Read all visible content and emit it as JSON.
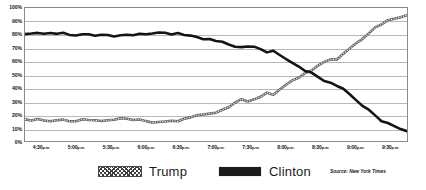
{
  "chart_data": {
    "type": "line",
    "title": "",
    "subtitle": "",
    "xlabel": "",
    "ylabel": "",
    "ylim": [
      0,
      100
    ],
    "ytick_labels": [
      "100%",
      "90%",
      "80%",
      "70%",
      "60%",
      "50%",
      "40%",
      "30%",
      "20%",
      "10%",
      "0%"
    ],
    "ytick_values": [
      100,
      90,
      80,
      70,
      60,
      50,
      40,
      30,
      20,
      10,
      0
    ],
    "xtick_labels": [
      "4:30 p.m.",
      "5:00 p.m.",
      "5:30 p.m.",
      "6:00 p.m.",
      "6:30 p.m.",
      "7:00 p.m.",
      "7:30 p.m.",
      "8:00 p.m.",
      "8:30 p.m.",
      "9:00 p.m.",
      "9:30 p.m."
    ],
    "xtick_times": [
      "4:30",
      "5:00",
      "5:30",
      "6:00",
      "6:30",
      "7:00",
      "7:30",
      "8:00",
      "8:30",
      "9:00",
      "9:30"
    ],
    "xtick_suffix": "p.m.",
    "grid": true,
    "legend_position": "bottom",
    "x": [
      0,
      1,
      2,
      3,
      4,
      5,
      6,
      7,
      8,
      9,
      10,
      11,
      12,
      13,
      14,
      15,
      16,
      17,
      18,
      19,
      20,
      21,
      22,
      23,
      24,
      25,
      26,
      27,
      28,
      29,
      30,
      31,
      32,
      33,
      34,
      35,
      36,
      37,
      38,
      39,
      40,
      41,
      42,
      43,
      44,
      45,
      46,
      47,
      48,
      49,
      50,
      51,
      52,
      53,
      54,
      55,
      56,
      57,
      58,
      59,
      60
    ],
    "series": [
      {
        "name": "Clinton",
        "color": "#1b1b1b",
        "style": "solid",
        "values": [
          80.5,
          81.5,
          81.5,
          81.0,
          81.5,
          81.0,
          81.0,
          80.5,
          80.0,
          80.5,
          80.0,
          79.5,
          80.0,
          79.5,
          79.0,
          79.5,
          80.0,
          79.5,
          80.0,
          80.5,
          81.0,
          82.0,
          81.0,
          80.5,
          81.0,
          80.0,
          79.0,
          78.0,
          77.0,
          76.0,
          75.0,
          74.0,
          72.5,
          71.5,
          70.0,
          70.5,
          71.0,
          69.0,
          67.0,
          68.5,
          65.0,
          62.0,
          59.0,
          56.0,
          53.0,
          51.0,
          48.0,
          45.0,
          43.5,
          42.0,
          39.0,
          35.0,
          31.0,
          27.0,
          23.0,
          19.0,
          15.5,
          13.0,
          11.0,
          9.5,
          8.0
        ]
      },
      {
        "name": "Trump",
        "color": "#5a5a5a",
        "style": "hatched",
        "values": [
          17.0,
          16.0,
          16.5,
          16.0,
          15.5,
          16.0,
          15.5,
          15.0,
          15.5,
          16.0,
          15.5,
          16.0,
          15.5,
          16.0,
          16.5,
          17.0,
          16.5,
          16.0,
          16.5,
          15.5,
          14.5,
          14.0,
          15.0,
          16.0,
          15.0,
          17.0,
          18.0,
          19.0,
          19.5,
          20.5,
          22.0,
          24.0,
          26.0,
          28.5,
          31.0,
          30.0,
          31.5,
          34.0,
          36.0,
          35.0,
          39.0,
          42.0,
          45.0,
          48.0,
          51.0,
          53.0,
          56.0,
          59.0,
          61.0,
          62.0,
          65.0,
          69.0,
          73.0,
          77.0,
          81.0,
          85.0,
          88.0,
          90.5,
          92.0,
          93.5,
          95.0
        ]
      }
    ],
    "series_end_values": {
      "Clinton": 3.0,
      "Trump": 97.0
    }
  },
  "legend": {
    "items": [
      {
        "label": "Trump",
        "swatch": "hatched-swatch"
      },
      {
        "label": "Clinton",
        "swatch": "solid-swatch"
      }
    ]
  },
  "source": {
    "text": "Source: New York Times"
  }
}
